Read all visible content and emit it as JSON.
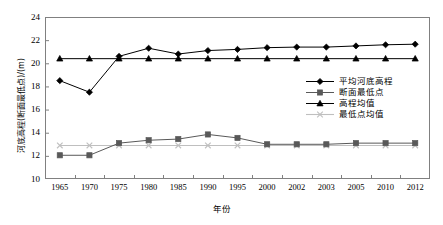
{
  "chart_data": {
    "type": "line",
    "title": "",
    "xlabel": "年份",
    "ylabel": "河底高程(断面最低点)/(m)",
    "categories": [
      "1965",
      "1970",
      "1975",
      "1980",
      "1985",
      "1990",
      "1995",
      "2000",
      "2002",
      "2003",
      "2005",
      "2010",
      "2012"
    ],
    "ylim": [
      10,
      24
    ],
    "yticks": [
      "10",
      "12",
      "14",
      "16",
      "18",
      "20",
      "22",
      "24"
    ],
    "grid": false,
    "legend_position": "right-middle",
    "series": [
      {
        "name": "平均河底高程",
        "marker": "diamond",
        "color": "#000000",
        "values": [
          18.5,
          17.5,
          20.6,
          21.3,
          20.8,
          21.1,
          21.2,
          21.35,
          21.4,
          21.4,
          21.5,
          21.6,
          21.65
        ]
      },
      {
        "name": "断面最低点",
        "marker": "square",
        "color": "#595959",
        "values": [
          12.05,
          12.05,
          13.1,
          13.35,
          13.45,
          13.85,
          13.55,
          13.0,
          13.0,
          13.0,
          13.1,
          13.1,
          13.1
        ]
      },
      {
        "name": "高程均值",
        "marker": "triangle",
        "color": "#000000",
        "values": [
          20.4,
          20.4,
          20.4,
          20.4,
          20.4,
          20.4,
          20.4,
          20.4,
          20.4,
          20.4,
          20.4,
          20.4,
          20.4
        ]
      },
      {
        "name": "最低点均值",
        "marker": "x",
        "color": "#bfbfbf",
        "values": [
          12.9,
          12.9,
          12.9,
          12.9,
          12.9,
          12.9,
          12.9,
          12.9,
          12.9,
          12.9,
          12.9,
          12.9,
          12.9
        ]
      }
    ]
  },
  "legend": {
    "items": [
      {
        "label": "平均河底高程"
      },
      {
        "label": "断面最低点"
      },
      {
        "label": "高程均值"
      },
      {
        "label": "最低点均值"
      }
    ]
  }
}
